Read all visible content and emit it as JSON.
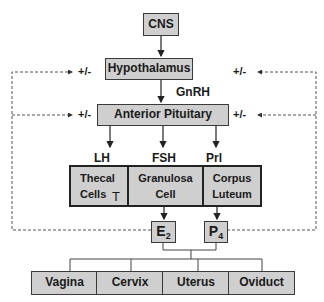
{
  "diagram": {
    "top": {
      "cns": "CNS",
      "hypothalamus": "Hypothalamus",
      "anterior_pituitary": "Anterior Pituitary"
    },
    "hormones": {
      "gnrh": "GnRH",
      "lh": "LH",
      "fsh": "FSH",
      "prl": "Prl",
      "t": "T"
    },
    "ovary_cells": {
      "thecal_line1": "Thecal",
      "thecal_line2": "Cells",
      "granulosa_line1": "Granulosa",
      "granulosa_line2": "Cell",
      "corpus_line1": "Corpus",
      "corpus_line2": "Luteum"
    },
    "steroids": {
      "e2_base": "E",
      "e2_sub": "2",
      "p4_base": "P",
      "p4_sub": "4"
    },
    "feedback_label": "+/-",
    "targets": [
      "Vagina",
      "Cervix",
      "Uterus",
      "Oviduct"
    ],
    "colors": {
      "box_fill": "#cfcfcf",
      "border": "#3a3a3a",
      "line": "#333333",
      "dashed": "#555555"
    }
  }
}
